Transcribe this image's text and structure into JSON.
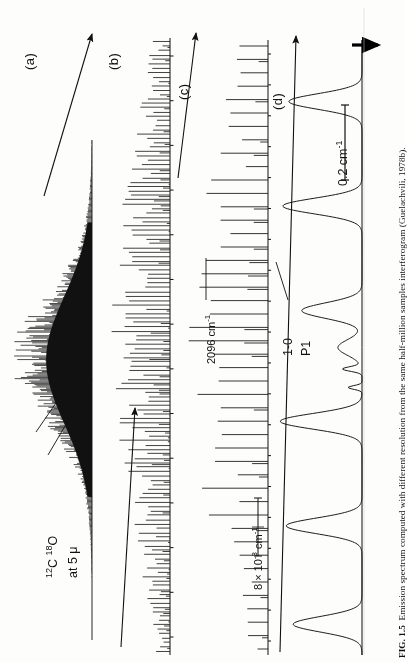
{
  "figure": {
    "id": "FIG. 1.5",
    "caption_text": "Emission spectrum computed with different resolution from the same half-million samples interferogram (Guelachvili, 1978b).",
    "orientation": "rotated-90-ccw",
    "background_color": "#fdfdfc",
    "ink_color": "#111111"
  },
  "panels": [
    {
      "key": "a",
      "label": "(a)",
      "description": "low-resolution envelope / unresolved band contour"
    },
    {
      "key": "b",
      "label": "(b)",
      "description": "partially resolved rotational line structure"
    },
    {
      "key": "c",
      "label": "(c)",
      "description": "resolved individual rotational lines"
    },
    {
      "key": "d",
      "label": "(d)",
      "description": "highest resolution, hyperfine/isotopic detail"
    }
  ],
  "annotations": {
    "sample": {
      "line1": "12C 18O",
      "line2": "at 5 μ",
      "isotope_c_mass": "12",
      "isotope_o_mass": "18",
      "element_c": "C",
      "element_o": "O",
      "wavelength": "at 5 μ"
    },
    "wavenumber_marker": {
      "text": "2096 cm-1",
      "value": "2096",
      "unit": "cm",
      "exponent": "-1"
    },
    "branch_label": {
      "line1": "1-0",
      "line2": "P1"
    },
    "resolution_bar": {
      "text": "8 x 10-3 cm-1",
      "mantissa": "8 × 10",
      "exponent": "-3",
      "unit": "cm",
      "unit_exponent": "-1"
    },
    "scale_bar": {
      "text": "0.2 cm-1",
      "value": "0.2",
      "unit": "cm",
      "exponent": "-1"
    },
    "pointer_arrow": {
      "name": "expansion-pointer",
      "direction": "right"
    }
  },
  "chart_data": {
    "type": "line",
    "title": "Emission spectrum computed with different resolution",
    "xlabel": "Wavenumber (cm-1)",
    "ylabel": "Emission intensity",
    "center_wavenumber": 2096,
    "panels": [
      {
        "key": "a",
        "label": "(a)",
        "type": "area",
        "n_points": 420,
        "resolution_cm1": 2.0,
        "peak_position_frac": 0.56,
        "peak_height": 1.0,
        "width_frac": 0.22,
        "noise": 0.38,
        "note": "unresolved contour, dense noisy fill"
      },
      {
        "key": "b",
        "label": "(b)",
        "type": "stick",
        "n_lines": 140,
        "resolution_cm1": 0.25,
        "envelope_peak_frac": 0.52,
        "envelope_width_frac": 0.4,
        "note": "dense comb of partially resolved lines"
      },
      {
        "key": "c",
        "label": "(c)",
        "type": "stick",
        "n_lines": 46,
        "resolution_cm1": 0.05,
        "envelope_peak_frac": 0.5,
        "envelope_width_frac": 0.45,
        "note": "resolved rotational lines with varying heights"
      },
      {
        "key": "d",
        "label": "(d)",
        "type": "profile",
        "n_lines": 7,
        "resolution_cm1": 0.008,
        "line_positions_frac": [
          0.1,
          0.27,
          0.44,
          0.5,
          0.62,
          0.79,
          0.95
        ],
        "line_heights": [
          0.85,
          0.92,
          0.7,
          0.28,
          0.95,
          0.88,
          0.8
        ],
        "note": "few broad fully-resolved lines; 8 x 10-3 cm-1 width marker"
      }
    ],
    "markers": [
      {
        "name": "2096 cm-1",
        "panel": "c",
        "position_frac": 0.5
      },
      {
        "name": "1-0 P1",
        "panel": "d",
        "position_frac": 0.5
      },
      {
        "name": "8 x 10-3 cm-1",
        "panel": "d",
        "type": "width-bar"
      },
      {
        "name": "0.2 cm-1",
        "panel": "d",
        "type": "scale-bar"
      }
    ],
    "grid": false,
    "legend": "none"
  }
}
